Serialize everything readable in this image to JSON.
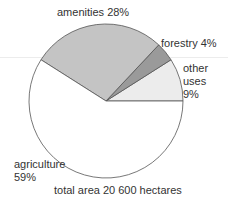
{
  "chart_data": {
    "type": "pie",
    "title": "",
    "caption": "total area 20 600 hectares",
    "slices": [
      {
        "name": "other uses",
        "value": 9,
        "label_lines": [
          "other",
          "uses",
          "9%"
        ],
        "color": "#ececec"
      },
      {
        "name": "forestry",
        "value": 4,
        "label_lines": [
          "forestry 4%"
        ],
        "color": "#9a9a9a"
      },
      {
        "name": "amenities",
        "value": 28,
        "label_lines": [
          "amenities 28%"
        ],
        "color": "#c4c4c4"
      },
      {
        "name": "agriculture",
        "value": 59,
        "label_lines": [
          "agriculture",
          "59%"
        ],
        "color": "#ffffff"
      }
    ],
    "start_angle_deg": 0,
    "direction": "counterclockwise",
    "legend": "none (direct labels)"
  },
  "labels": {
    "amenities": "amenities 28%",
    "forestry": "forestry 4%",
    "other_1": "other",
    "other_2": "uses",
    "other_3": "9%",
    "agri_1": "agriculture",
    "agri_2": "59%",
    "caption": "total area 20 600 hectares"
  },
  "geometry": {
    "cx": 106,
    "cy": 101,
    "r": 77
  }
}
